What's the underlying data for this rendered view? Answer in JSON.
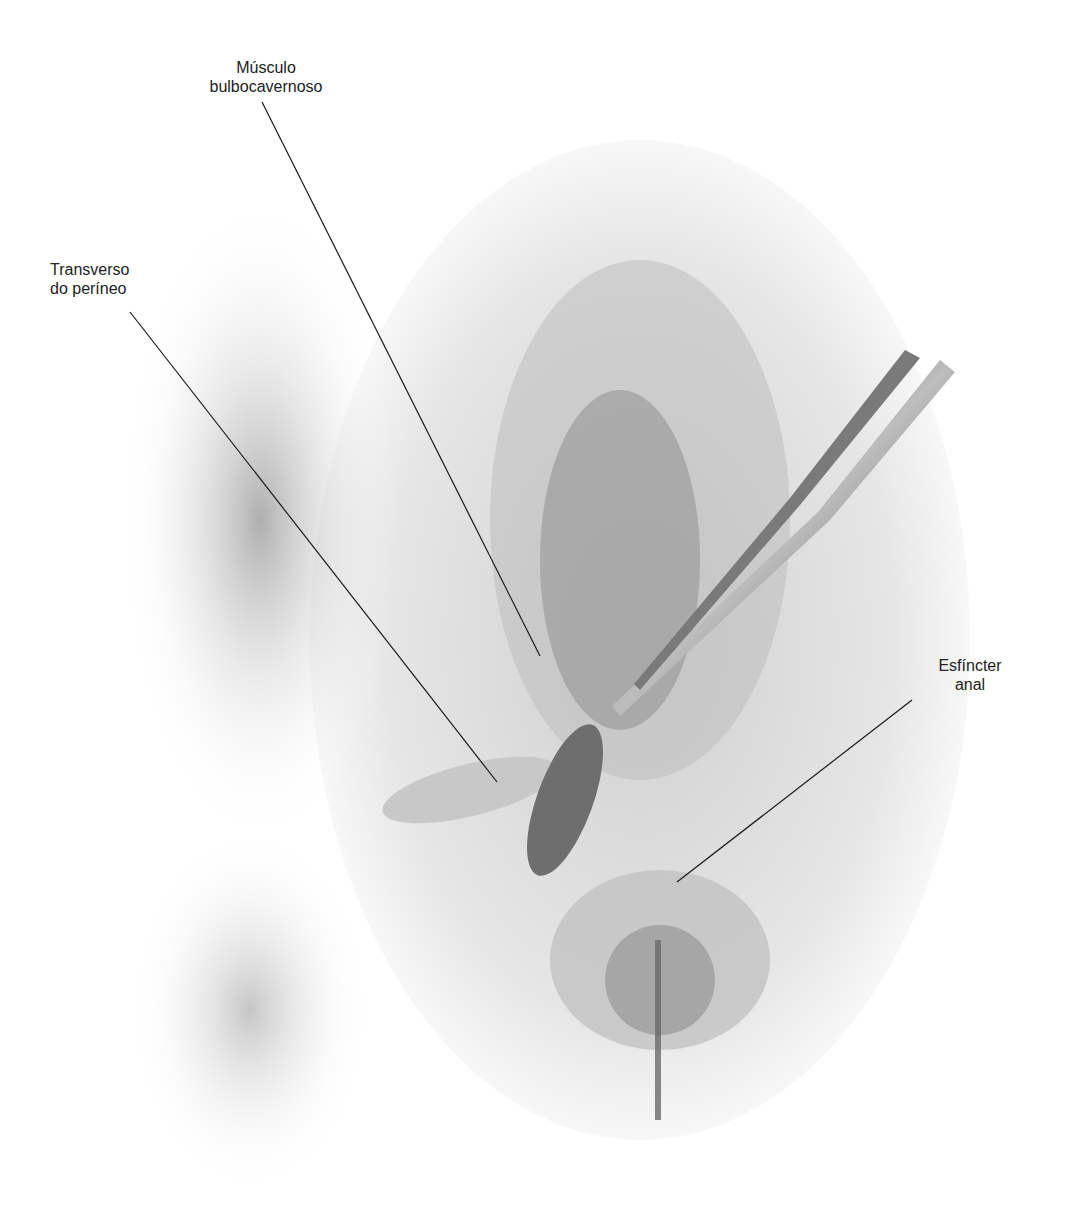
{
  "figure": {
    "type": "anatomical-illustration-schematic",
    "labels": [
      {
        "id": "bulbo",
        "lines": [
          "Músculo",
          "bulbocavernoso"
        ]
      },
      {
        "id": "transverso",
        "lines": [
          "Transverso",
          "do períneo"
        ]
      },
      {
        "id": "esfincter",
        "lines": [
          "Esfíncter",
          "anal"
        ]
      }
    ],
    "colors": {
      "background": "#ffffff",
      "tissue_light": "#d9d9d9",
      "tissue_mid": "#a8a8a8",
      "tissue_dark": "#5a5a5a",
      "leader_line": "#1a1a1a",
      "text": "#222222"
    }
  }
}
